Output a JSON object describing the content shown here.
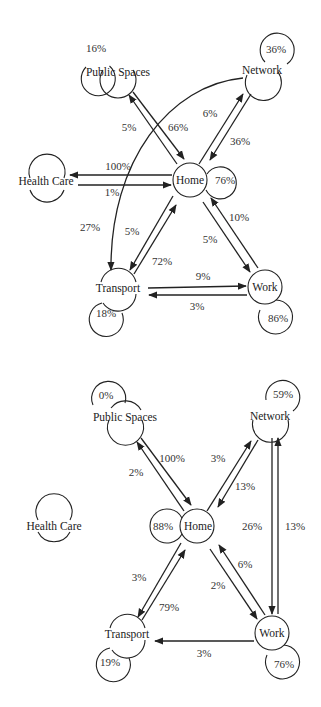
{
  "diagrams": [
    {
      "id": "top",
      "nodes": {
        "public_spaces": {
          "label": "Public Spaces",
          "self_loop": "16%"
        },
        "network": {
          "label": "Network",
          "self_loop": "36%"
        },
        "home": {
          "label": "Home",
          "self_loop": "76%"
        },
        "health_care": {
          "label": "Health Care",
          "self_loop": ""
        },
        "transport": {
          "label": "Transport",
          "self_loop": "18%"
        },
        "work": {
          "label": "Work",
          "self_loop": "86%"
        }
      },
      "edges": {
        "public_to_home": "66%",
        "home_to_public": "5%",
        "home_to_network": "6%",
        "network_to_home": "36%",
        "home_to_health": "100%",
        "health_to_home": "1%",
        "network_to_transport": "27%",
        "home_to_transport": "5%",
        "transport_to_home": "72%",
        "home_to_work": "5%",
        "work_to_home": "10%",
        "transport_to_work": "9%",
        "work_to_transport": "3%"
      }
    },
    {
      "id": "bottom",
      "nodes": {
        "public_spaces": {
          "label": "Public Spaces",
          "self_loop": "0%"
        },
        "network": {
          "label": "Network",
          "self_loop": "59%"
        },
        "home": {
          "label": "Home",
          "self_loop": "88%"
        },
        "health_care": {
          "label": "Health Care",
          "self_loop": ""
        },
        "transport": {
          "label": "Transport",
          "self_loop": "19%"
        },
        "work": {
          "label": "Work",
          "self_loop": "76%"
        }
      },
      "edges": {
        "public_to_home": "100%",
        "home_to_public": "2%",
        "home_to_network": "3%",
        "network_to_home": "13%",
        "network_to_work": "26%",
        "work_to_network": "13%",
        "home_to_transport": "3%",
        "transport_to_home": "79%",
        "home_to_work": "2%",
        "work_to_home": "6%",
        "work_to_transport": "3%"
      }
    }
  ]
}
